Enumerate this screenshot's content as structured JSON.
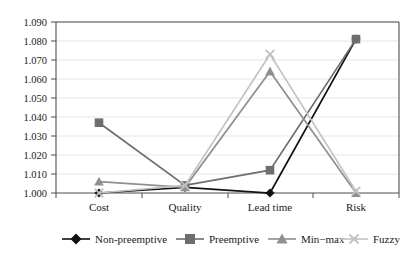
{
  "chart_data": {
    "type": "line",
    "title": "",
    "xlabel": "",
    "ylabel": "",
    "categories": [
      "Cost",
      "Quality",
      "Lead time",
      "Risk"
    ],
    "ylim": [
      1.0,
      1.09
    ],
    "yticks": [
      "1.000",
      "1.010",
      "1.020",
      "1.030",
      "1.040",
      "1.050",
      "1.060",
      "1.070",
      "1.080",
      "1.090"
    ],
    "ytick_values": [
      1.0,
      1.01,
      1.02,
      1.03,
      1.04,
      1.05,
      1.06,
      1.07,
      1.08,
      1.09
    ],
    "grid": true,
    "legend_position": "bottom",
    "series": [
      {
        "name": "Non-preemptive",
        "marker": "diamond",
        "color": "#111111",
        "values": [
          1.0,
          1.003,
          1.0,
          1.081
        ]
      },
      {
        "name": "Preemptive",
        "marker": "square",
        "color": "#6e6e6e",
        "values": [
          1.037,
          1.004,
          1.012,
          1.081
        ]
      },
      {
        "name": "Min−max",
        "marker": "triangle",
        "color": "#8f8f8f",
        "values": [
          1.006,
          1.003,
          1.064,
          1.0
        ]
      },
      {
        "name": "Fuzzy",
        "marker": "cross",
        "color": "#c2c2c2",
        "values": [
          1.0,
          1.004,
          1.073,
          1.001
        ]
      }
    ]
  },
  "axis": {
    "tick_0": "1.000",
    "tick_1": "1.010",
    "tick_2": "1.020",
    "tick_3": "1.030",
    "tick_4": "1.040",
    "tick_5": "1.050",
    "tick_6": "1.060",
    "tick_7": "1.070",
    "tick_8": "1.080",
    "tick_9": "1.090",
    "cat_0": "Cost",
    "cat_1": "Quality",
    "cat_2": "Lead time",
    "cat_3": "Risk"
  },
  "legend": {
    "item_0": "Non-preemptive",
    "item_1": "Preemptive",
    "item_2": "Min−max",
    "item_3": "Fuzzy"
  },
  "colors": {
    "non_preemptive": "#111111",
    "preemptive": "#6e6e6e",
    "minmax": "#8f8f8f",
    "fuzzy": "#c2c2c2",
    "axis": "#555555",
    "grid": "#e3e3e3"
  }
}
